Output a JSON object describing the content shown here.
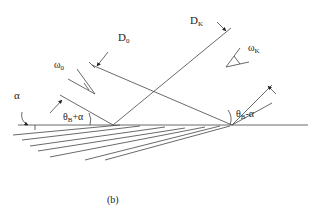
{
  "figure": {
    "caption": "(b)",
    "labels": {
      "alpha": "α",
      "D0": "D",
      "D0_sub": "0",
      "DK": "D",
      "DK_sub": "K",
      "omega0": "ω",
      "omega0_sub": "0",
      "omegaK": "ω",
      "omegaK_sub": "K",
      "theta_plus": "θ",
      "theta_plus_sub": "B",
      "theta_plus_suffix": "+α",
      "theta_minus": "θ",
      "theta_minus_sub": "B",
      "theta_minus_suffix": "-α"
    }
  }
}
